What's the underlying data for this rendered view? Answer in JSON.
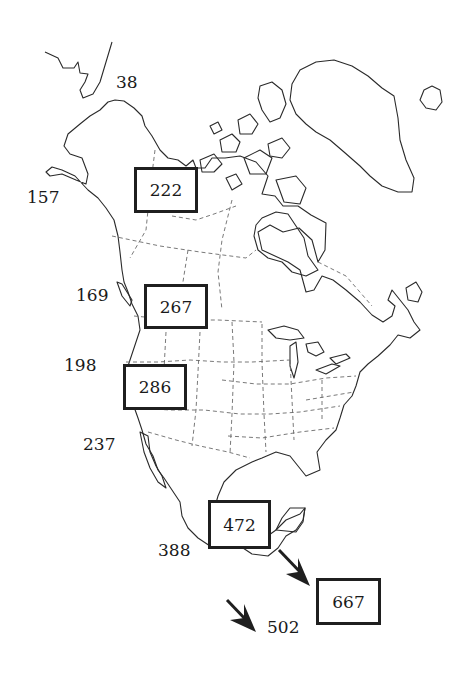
{
  "map": {
    "region": "North America",
    "boxed_values": [
      {
        "id": "alaska-yukon",
        "value": "222"
      },
      {
        "id": "interior-northwest",
        "value": "267"
      },
      {
        "id": "great-basin",
        "value": "286"
      },
      {
        "id": "mexico",
        "value": "472"
      },
      {
        "id": "central-america",
        "value": "667"
      }
    ],
    "coastal_values": [
      {
        "id": "bering",
        "value": "38"
      },
      {
        "id": "gulf-of-alaska",
        "value": "157"
      },
      {
        "id": "pacific-northwest",
        "value": "169"
      },
      {
        "id": "northern-california",
        "value": "198"
      },
      {
        "id": "southern-california",
        "value": "237"
      },
      {
        "id": "pacific-mexico",
        "value": "388"
      },
      {
        "id": "pacific-central-america",
        "value": "502"
      }
    ],
    "arrows": [
      {
        "id": "arrow-to-central-america",
        "direction": "southeast"
      },
      {
        "id": "arrow-to-502",
        "direction": "southeast"
      }
    ],
    "colors": {
      "outline": "#2a2a2a",
      "borders": "#6a6a6a",
      "box": "#1f1f1f",
      "background": "#ffffff"
    }
  }
}
